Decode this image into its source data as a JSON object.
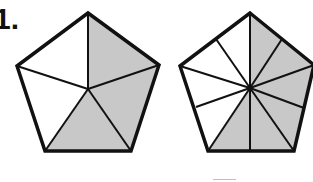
{
  "problem": {
    "number_label": "1.",
    "colors": {
      "shaded": "#c8c8c8",
      "unshaded": "#ffffff",
      "stroke": "#111111"
    }
  },
  "figures": [
    {
      "name": "pentagon-fifths",
      "total_parts": 5,
      "shaded_parts": 3,
      "fraction": "3/5"
    },
    {
      "name": "pentagon-tenths",
      "total_parts": 10,
      "shaded_parts": 6,
      "fraction": "6/10"
    }
  ]
}
